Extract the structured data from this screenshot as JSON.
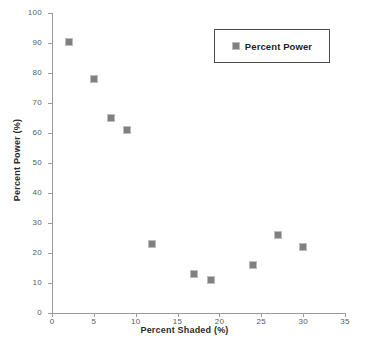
{
  "chart_data": {
    "type": "scatter",
    "title": "",
    "xlabel": "Percent Shaded (%)",
    "ylabel": "Percent Power (%)",
    "xlim": [
      0,
      35
    ],
    "ylim": [
      0,
      100
    ],
    "xticks": [
      0,
      5,
      10,
      15,
      20,
      25,
      30,
      35
    ],
    "yticks": [
      0,
      10,
      20,
      30,
      40,
      50,
      60,
      70,
      80,
      90,
      100
    ],
    "grid": false,
    "legend_position": "top-right",
    "marker_color": "#808080",
    "marker_shape": "square",
    "series": [
      {
        "name": "Percent Power",
        "points": [
          {
            "x": 2,
            "y": 90.5
          },
          {
            "x": 5,
            "y": 78
          },
          {
            "x": 7,
            "y": 65
          },
          {
            "x": 9,
            "y": 61
          },
          {
            "x": 12,
            "y": 23
          },
          {
            "x": 17,
            "y": 13
          },
          {
            "x": 19,
            "y": 11
          },
          {
            "x": 24,
            "y": 16
          },
          {
            "x": 27,
            "y": 26
          },
          {
            "x": 30,
            "y": 22
          }
        ]
      }
    ]
  },
  "legend": {
    "entries": [
      {
        "label": "Percent Power",
        "color": "#808080"
      }
    ]
  },
  "axes": {
    "x_title": "Percent Shaded (%)",
    "y_title": "Percent Power (%)",
    "x_tick_labels": [
      "0",
      "5",
      "10",
      "15",
      "20",
      "25",
      "30",
      "35"
    ],
    "y_tick_labels": [
      "0",
      "10",
      "20",
      "30",
      "40",
      "50",
      "60",
      "70",
      "80",
      "90",
      "100"
    ]
  }
}
